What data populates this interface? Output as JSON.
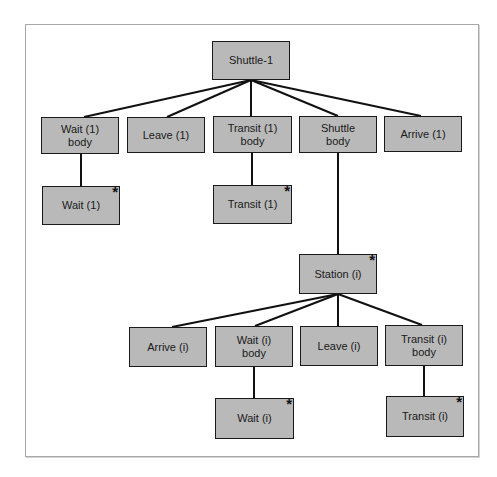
{
  "diagram": {
    "title": "",
    "colors": {
      "node_fill": "#b9b9b9",
      "node_border": "#1a1a1a",
      "edge": "#111111",
      "frame": "#a8a8a8"
    },
    "nodes": [
      {
        "id": "shuttle1",
        "label": "Shuttle-1",
        "star": false,
        "x": 212,
        "y": 41,
        "w": 78,
        "h": 39
      },
      {
        "id": "wait1body",
        "label": "Wait (1)\nbody",
        "star": false,
        "x": 41,
        "y": 117,
        "w": 78,
        "h": 37
      },
      {
        "id": "leave1",
        "label": "Leave (1)",
        "star": false,
        "x": 127,
        "y": 117,
        "w": 78,
        "h": 36
      },
      {
        "id": "transit1body",
        "label": "Transit (1)\nbody",
        "star": false,
        "x": 213,
        "y": 116,
        "w": 79,
        "h": 37
      },
      {
        "id": "shuttlebody",
        "label": "Shuttle\nbody",
        "star": false,
        "x": 299,
        "y": 116,
        "w": 78,
        "h": 37
      },
      {
        "id": "arrive1",
        "label": "Arrive (1)",
        "star": false,
        "x": 384,
        "y": 116,
        "w": 78,
        "h": 36
      },
      {
        "id": "wait1",
        "label": "Wait (1)",
        "star": true,
        "x": 42,
        "y": 186,
        "w": 78,
        "h": 39
      },
      {
        "id": "transit1",
        "label": "Transit (1)",
        "star": true,
        "x": 213,
        "y": 185,
        "w": 79,
        "h": 39
      },
      {
        "id": "stationi",
        "label": "Station (i)",
        "star": true,
        "x": 299,
        "y": 254,
        "w": 78,
        "h": 40
      },
      {
        "id": "arrivei",
        "label": "Arrive (i)",
        "star": false,
        "x": 129,
        "y": 327,
        "w": 78,
        "h": 40
      },
      {
        "id": "waitibody",
        "label": "Wait (i)\nbody",
        "star": false,
        "x": 215,
        "y": 326,
        "w": 78,
        "h": 41
      },
      {
        "id": "leavei",
        "label": "Leave (i)",
        "star": false,
        "x": 300,
        "y": 326,
        "w": 78,
        "h": 40
      },
      {
        "id": "transitibody",
        "label": "Transit (i)\nbody",
        "star": false,
        "x": 385,
        "y": 325,
        "w": 78,
        "h": 41
      },
      {
        "id": "waiti",
        "label": "Wait (i)",
        "star": true,
        "x": 215,
        "y": 398,
        "w": 79,
        "h": 41
      },
      {
        "id": "transiti",
        "label": "Transit (i)",
        "star": true,
        "x": 386,
        "y": 396,
        "w": 78,
        "h": 41
      }
    ],
    "edges": [
      {
        "from": "shuttle1",
        "to": "wait1body",
        "x1": 251,
        "y1": 80,
        "x2": 84,
        "y2": 117
      },
      {
        "from": "shuttle1",
        "to": "leave1",
        "x1": 251,
        "y1": 80,
        "x2": 167,
        "y2": 117
      },
      {
        "from": "shuttle1",
        "to": "transit1body",
        "x1": 251,
        "y1": 80,
        "x2": 251,
        "y2": 116
      },
      {
        "from": "shuttle1",
        "to": "shuttlebody",
        "x1": 251,
        "y1": 80,
        "x2": 338,
        "y2": 116
      },
      {
        "from": "shuttle1",
        "to": "arrive1",
        "x1": 251,
        "y1": 80,
        "x2": 421,
        "y2": 116
      },
      {
        "from": "wait1body",
        "to": "wait1",
        "x1": 81,
        "y1": 154,
        "x2": 81,
        "y2": 186
      },
      {
        "from": "transit1body",
        "to": "transit1",
        "x1": 252,
        "y1": 153,
        "x2": 252,
        "y2": 185
      },
      {
        "from": "shuttlebody",
        "to": "stationi",
        "x1": 338,
        "y1": 153,
        "x2": 338,
        "y2": 254
      },
      {
        "from": "stationi",
        "to": "arrivei",
        "x1": 338,
        "y1": 294,
        "x2": 172,
        "y2": 327
      },
      {
        "from": "stationi",
        "to": "waitibody",
        "x1": 338,
        "y1": 294,
        "x2": 255,
        "y2": 326
      },
      {
        "from": "stationi",
        "to": "leavei",
        "x1": 338,
        "y1": 294,
        "x2": 338,
        "y2": 326
      },
      {
        "from": "stationi",
        "to": "transitibody",
        "x1": 338,
        "y1": 294,
        "x2": 422,
        "y2": 325
      },
      {
        "from": "waitibody",
        "to": "waiti",
        "x1": 254,
        "y1": 367,
        "x2": 254,
        "y2": 398
      },
      {
        "from": "transitibody",
        "to": "transiti",
        "x1": 424,
        "y1": 366,
        "x2": 424,
        "y2": 396
      }
    ],
    "star_glyph": "*"
  }
}
